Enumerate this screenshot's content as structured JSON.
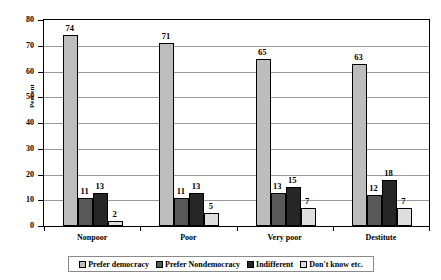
{
  "chart_data": {
    "type": "bar",
    "title": "",
    "xlabel": "",
    "ylabel": "Percent",
    "ylim": [
      0,
      80
    ],
    "ytick_step": 10,
    "yticks": [
      "0",
      "10",
      "20",
      "30",
      "40",
      "50",
      "60",
      "70",
      "80"
    ],
    "grid": true,
    "legend_position": "bottom",
    "categories": [
      "Nonpoor",
      "Poor",
      "Very poor",
      "Destitute"
    ],
    "series": [
      {
        "name": "Prefer democracy",
        "color": "#bdbdbd",
        "values": [
          74,
          71,
          65,
          63
        ]
      },
      {
        "name": "Prefer Nondemocracy",
        "color": "#585858",
        "values": [
          11,
          11,
          13,
          12
        ]
      },
      {
        "name": "Indifferent",
        "color": "#262626",
        "values": [
          13,
          13,
          15,
          18
        ]
      },
      {
        "name": "Don't know etc.",
        "color": "#dedede",
        "values": [
          2,
          5,
          7,
          7
        ]
      }
    ],
    "data_labels": [
      [
        "74",
        "11",
        "13",
        "2"
      ],
      [
        "71",
        "11",
        "13",
        "5"
      ],
      [
        "65",
        "13",
        "15",
        "7"
      ],
      [
        "63",
        "12",
        "18",
        "7"
      ]
    ]
  }
}
